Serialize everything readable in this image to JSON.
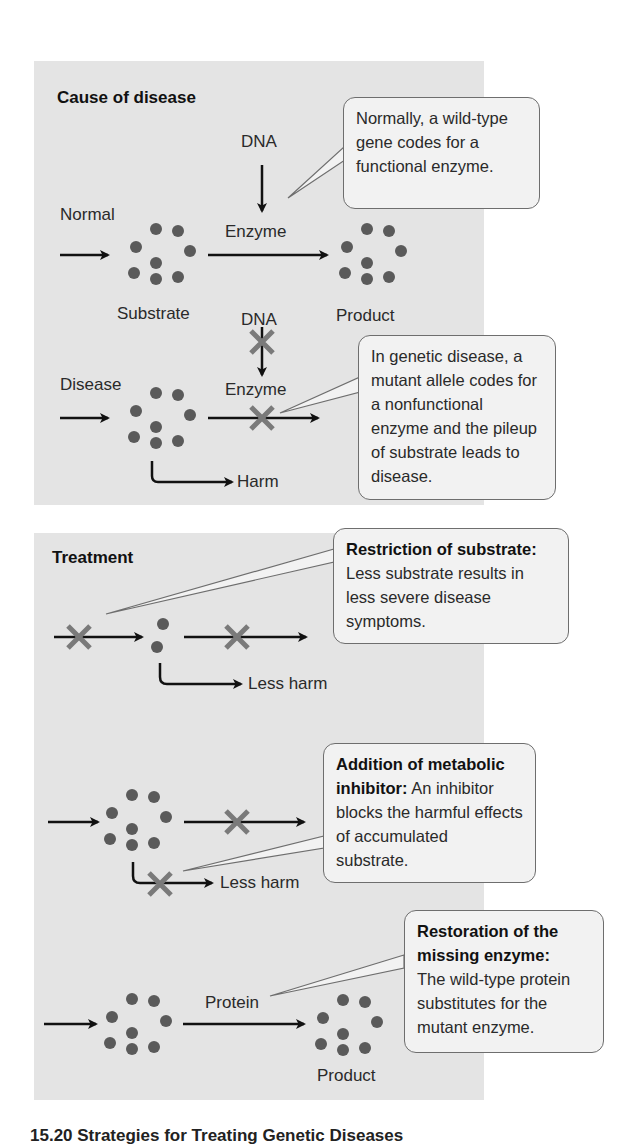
{
  "figure": {
    "caption": "15.20 Strategies for Treating Genetic Diseases",
    "colors": {
      "panel_bg": "#e4e4e4",
      "callout_bg": "#f2f2f2",
      "molecule": "#5a5a5a",
      "block_x": "#7a7a7a",
      "arrow": "#111111"
    }
  },
  "cause_panel": {
    "title": "Cause of disease",
    "normal_row": {
      "input_label": "Normal",
      "dna_label": "DNA",
      "enzyme_label": "Enzyme",
      "substrate_label": "Substrate",
      "product_label": "Product",
      "callout": "Normally, a wild-type gene codes for a functional enzyme."
    },
    "disease_row": {
      "input_label": "Disease",
      "dna_label": "DNA",
      "enzyme_label": "Enzyme",
      "harm_label": "Harm",
      "callout": "In genetic disease, a mutant allele codes for a nonfunctional enzyme and the pileup of substrate leads to disease."
    }
  },
  "treatment_panel": {
    "title": "Treatment",
    "restriction": {
      "callout_title": "Restriction of substrate:",
      "callout_body": "Less substrate results in less severe disease symptoms.",
      "harm_label": "Less harm"
    },
    "inhibitor": {
      "callout_title": "Addition of metabolic inhibitor:",
      "callout_body": "An inhibitor blocks the harmful effects of accumulated substrate.",
      "harm_label": "Less harm"
    },
    "restoration": {
      "callout_title": "Restoration of the missing enzyme:",
      "callout_body": "The wild-type protein substitutes for the mutant enzyme.",
      "protein_label": "Protein",
      "product_label": "Product"
    }
  }
}
